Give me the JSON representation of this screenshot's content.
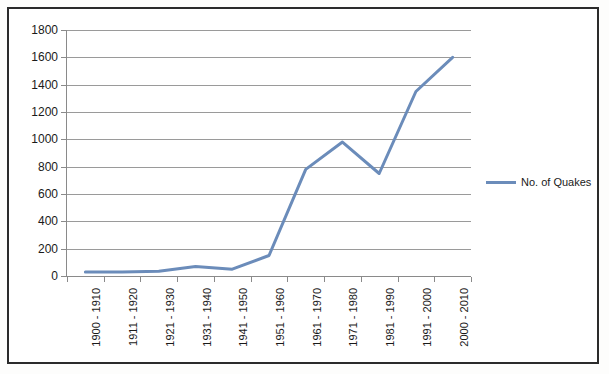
{
  "chart_data": {
    "type": "line",
    "title": "",
    "subtitle": "",
    "xlabel": "",
    "ylabel": "",
    "categories": [
      "1900 - 1910",
      "1911 - 1920",
      "1921 - 1930",
      "1931 - 1940",
      "1941 - 1950",
      "1951 - 1960",
      "1961 - 1970",
      "1971 - 1980",
      "1981 - 1990",
      "1991 - 2000",
      "2000 - 2010"
    ],
    "series": [
      {
        "name": "No. of Quakes",
        "color": "#6b8cba",
        "values": [
          30,
          30,
          35,
          70,
          50,
          150,
          780,
          980,
          750,
          1350,
          1600
        ]
      }
    ],
    "ylim": [
      0,
      1800
    ],
    "ytick_labels": [
      "1800",
      "1600",
      "1400",
      "1200",
      "1000",
      "800",
      "600",
      "400",
      "200",
      "0"
    ],
    "ytick_values": [
      1800,
      1600,
      1400,
      1200,
      1000,
      800,
      600,
      400,
      200,
      0
    ],
    "grid": true,
    "legend_position": "right",
    "legend_entries": [
      "No. of Quakes"
    ]
  },
  "legend": {
    "label": "No. of Quakes"
  },
  "colors": {
    "series_line": "#6b8cba",
    "gridline": "#9a9a9a",
    "frame": "#2b2b2b",
    "text": "#1a1a1a"
  }
}
